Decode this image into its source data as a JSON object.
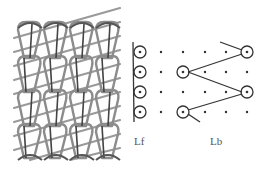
{
  "figure": {
    "left_panel": {
      "description": "knitted fabric structure with warp loops and laid-in diagonal yarns",
      "rows": 4,
      "columns": 4
    },
    "right_panel": {
      "labels": {
        "front": "Lf",
        "back": "Lb"
      },
      "grid_rows": 4,
      "front_bar_columns": 2,
      "back_bar_columns": 4,
      "colors": {
        "line": "#333333",
        "dot": "#333333",
        "fabric_loop": "#555555",
        "fabric_inlay": "#999999"
      }
    }
  }
}
